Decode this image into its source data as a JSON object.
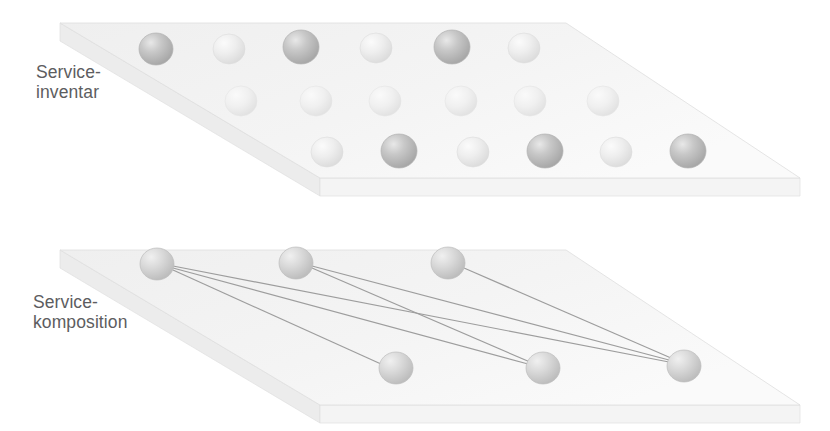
{
  "figure": {
    "type": "layered-3d-plane-diagram",
    "background_color": "#ffffff",
    "width": 830,
    "height": 431
  },
  "labels": {
    "upper_plane": "Service-\ninventar",
    "lower_plane": "Service-\nkomposition",
    "text_color": "#5d5d60"
  },
  "colors": {
    "plane_top_face": "#f2f2f2",
    "plane_top_face_light": "#f7f7f7",
    "plane_side_face": "#ededed",
    "plane_front_face": "#f5f5f5",
    "plane_edge": "#dcdcdc",
    "sphere_dark": "#b8b8b8",
    "sphere_light": "#e4e4e4",
    "sphere_mid": "#cfcfcf",
    "connection_line": "#9a9a9a"
  },
  "planes": [
    {
      "id": "service-inventory-plane",
      "name": "Service-inventar",
      "top_face_points": "60,23 566,23 800,178 320,178",
      "front_face_points": "320,178 800,178 800,196 320,196",
      "side_face_points": "60,23 320,178 320,196 60,41",
      "thickness": 18
    },
    {
      "id": "service-composition-plane",
      "name": "Service-komposition",
      "top_face_points": "60,250 566,250 800,405 320,405",
      "front_face_points": "320,405 800,405 800,423 320,423",
      "side_face_points": "60,250 320,405 320,423 60,268",
      "thickness": 18
    }
  ],
  "inventory_spheres": {
    "count": 18,
    "rows": 3,
    "columns": 6,
    "items": [
      {
        "id": "inv-r1-c1",
        "cx": 156,
        "cy": 49,
        "rx": 17,
        "ry": 16,
        "shade": "dark"
      },
      {
        "id": "inv-r1-c2",
        "cx": 229,
        "cy": 49,
        "rx": 16,
        "ry": 15,
        "shade": "light"
      },
      {
        "id": "inv-r1-c3",
        "cx": 301,
        "cy": 47,
        "rx": 18,
        "ry": 17,
        "shade": "dark"
      },
      {
        "id": "inv-r1-c4",
        "cx": 376,
        "cy": 48,
        "rx": 16,
        "ry": 15,
        "shade": "light"
      },
      {
        "id": "inv-r1-c5",
        "cx": 452,
        "cy": 47,
        "rx": 18,
        "ry": 17,
        "shade": "dark"
      },
      {
        "id": "inv-r1-c6",
        "cx": 524,
        "cy": 48,
        "rx": 16,
        "ry": 15,
        "shade": "light"
      },
      {
        "id": "inv-r2-c1",
        "cx": 241,
        "cy": 101,
        "rx": 16,
        "ry": 15,
        "shade": "faint"
      },
      {
        "id": "inv-r2-c2",
        "cx": 316,
        "cy": 101,
        "rx": 16,
        "ry": 15,
        "shade": "faint"
      },
      {
        "id": "inv-r2-c3",
        "cx": 385,
        "cy": 101,
        "rx": 16,
        "ry": 15,
        "shade": "faint"
      },
      {
        "id": "inv-r2-c4",
        "cx": 461,
        "cy": 101,
        "rx": 16,
        "ry": 15,
        "shade": "faint"
      },
      {
        "id": "inv-r2-c5",
        "cx": 530,
        "cy": 101,
        "rx": 16,
        "ry": 15,
        "shade": "faint"
      },
      {
        "id": "inv-r2-c6",
        "cx": 603,
        "cy": 101,
        "rx": 16,
        "ry": 15,
        "shade": "faint"
      },
      {
        "id": "inv-r3-c1",
        "cx": 327,
        "cy": 152,
        "rx": 16,
        "ry": 15,
        "shade": "light"
      },
      {
        "id": "inv-r3-c2",
        "cx": 399,
        "cy": 151,
        "rx": 18,
        "ry": 17,
        "shade": "dark"
      },
      {
        "id": "inv-r3-c3",
        "cx": 473,
        "cy": 152,
        "rx": 16,
        "ry": 15,
        "shade": "light"
      },
      {
        "id": "inv-r3-c4",
        "cx": 545,
        "cy": 151,
        "rx": 18,
        "ry": 17,
        "shade": "dark"
      },
      {
        "id": "inv-r3-c5",
        "cx": 616,
        "cy": 152,
        "rx": 16,
        "ry": 15,
        "shade": "light"
      },
      {
        "id": "inv-r3-c6",
        "cx": 688,
        "cy": 151,
        "rx": 18,
        "ry": 17,
        "shade": "dark"
      }
    ]
  },
  "composition_spheres": {
    "count": 6,
    "items": [
      {
        "id": "comp-back-1",
        "cx": 157,
        "cy": 264,
        "rx": 17,
        "ry": 16,
        "shade": "mid"
      },
      {
        "id": "comp-back-2",
        "cx": 296,
        "cy": 263,
        "rx": 17,
        "ry": 16,
        "shade": "mid"
      },
      {
        "id": "comp-back-3",
        "cx": 448,
        "cy": 263,
        "rx": 17,
        "ry": 16,
        "shade": "mid"
      },
      {
        "id": "comp-front-1",
        "cx": 396,
        "cy": 368,
        "rx": 17,
        "ry": 16,
        "shade": "mid"
      },
      {
        "id": "comp-front-2",
        "cx": 543,
        "cy": 368,
        "rx": 17,
        "ry": 16,
        "shade": "mid"
      },
      {
        "id": "comp-front-3",
        "cx": 684,
        "cy": 366,
        "rx": 17,
        "ry": 16,
        "shade": "mid"
      }
    ]
  },
  "connections": [
    {
      "id": "link-1",
      "from": "comp-back-1",
      "to": "comp-front-1",
      "x1": 173,
      "y1": 270,
      "x2": 381,
      "y2": 364
    },
    {
      "id": "link-2",
      "from": "comp-back-1",
      "to": "comp-front-2",
      "x1": 173,
      "y1": 268,
      "x2": 528,
      "y2": 364
    },
    {
      "id": "link-3",
      "from": "comp-back-1",
      "to": "comp-front-3",
      "x1": 173,
      "y1": 266,
      "x2": 669,
      "y2": 362
    },
    {
      "id": "link-4",
      "from": "comp-back-2",
      "to": "comp-front-2",
      "x1": 312,
      "y1": 268,
      "x2": 530,
      "y2": 362
    },
    {
      "id": "link-5",
      "from": "comp-back-2",
      "to": "comp-front-3",
      "x1": 312,
      "y1": 266,
      "x2": 669,
      "y2": 360
    },
    {
      "id": "link-6",
      "from": "comp-back-3",
      "to": "comp-front-3",
      "x1": 464,
      "y1": 268,
      "x2": 671,
      "y2": 358
    }
  ]
}
